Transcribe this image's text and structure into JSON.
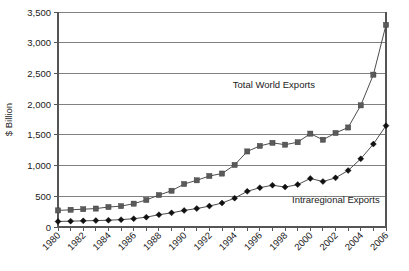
{
  "chart_data": {
    "type": "line",
    "title": "",
    "xlabel": "",
    "ylabel": "$ Billion",
    "ylim": [
      0,
      3500
    ],
    "yticks": [
      0,
      500,
      1000,
      1500,
      2000,
      2500,
      3000,
      3500
    ],
    "ytick_labels": [
      "0",
      "500",
      "1,000",
      "1,500",
      "2,000",
      "2,500",
      "3,000",
      "3,500"
    ],
    "grid": true,
    "legend_position": "inline-annotation",
    "x": [
      1980,
      1981,
      1982,
      1983,
      1984,
      1985,
      1986,
      1987,
      1988,
      1989,
      1990,
      1991,
      1992,
      1993,
      1994,
      1995,
      1996,
      1997,
      1998,
      1999,
      2000,
      2001,
      2002,
      2003,
      2004,
      2005,
      2006
    ],
    "xtick_labels": [
      "1980",
      "1982",
      "1984",
      "1986",
      "1988",
      "1990",
      "1992",
      "1994",
      "1996",
      "1998",
      "2000",
      "2002",
      "2004",
      "2006"
    ],
    "xtick_values": [
      1980,
      1982,
      1984,
      1986,
      1988,
      1990,
      1992,
      1994,
      1996,
      1998,
      2000,
      2002,
      2004,
      2006
    ],
    "series": [
      {
        "name": "Total World Exports",
        "marker": "square",
        "values": [
          270,
          280,
          290,
          300,
          325,
          340,
          380,
          440,
          520,
          590,
          700,
          760,
          830,
          870,
          1010,
          1230,
          1320,
          1370,
          1340,
          1380,
          1520,
          1420,
          1530,
          1620,
          1980,
          2480,
          3290
        ]
      },
      {
        "name": "Intraregional Exports",
        "marker": "diamond",
        "values": [
          90,
          95,
          100,
          105,
          110,
          120,
          135,
          160,
          200,
          230,
          270,
          300,
          340,
          390,
          470,
          580,
          640,
          680,
          650,
          690,
          790,
          740,
          800,
          920,
          1110,
          1350,
          1650
        ]
      }
    ],
    "annotations": [
      {
        "text": "Total World Exports",
        "series": "Total World Exports"
      },
      {
        "text": "Intraregional Exports",
        "series": "Intraregional Exports"
      }
    ]
  }
}
